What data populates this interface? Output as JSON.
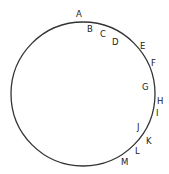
{
  "diagram": {
    "shape": "circle",
    "circle": {
      "cx": 83,
      "cy": 94,
      "r": 72,
      "stroke": "#333333"
    },
    "labels": [
      {
        "text": "A",
        "x": 76,
        "y": 17
      },
      {
        "text": "B",
        "x": 87,
        "y": 32
      },
      {
        "text": "C",
        "x": 100,
        "y": 37
      },
      {
        "text": "D",
        "x": 112,
        "y": 45
      },
      {
        "text": "E",
        "x": 140,
        "y": 49
      },
      {
        "text": "F",
        "x": 151,
        "y": 66
      },
      {
        "text": "G",
        "x": 142,
        "y": 90
      },
      {
        "text": "H",
        "x": 157,
        "y": 104
      },
      {
        "text": "I",
        "x": 156,
        "y": 116
      },
      {
        "text": "J",
        "x": 137,
        "y": 130
      },
      {
        "text": "K",
        "x": 146,
        "y": 144
      },
      {
        "text": "L",
        "x": 135,
        "y": 154
      },
      {
        "text": "M",
        "x": 121,
        "y": 165
      }
    ]
  }
}
